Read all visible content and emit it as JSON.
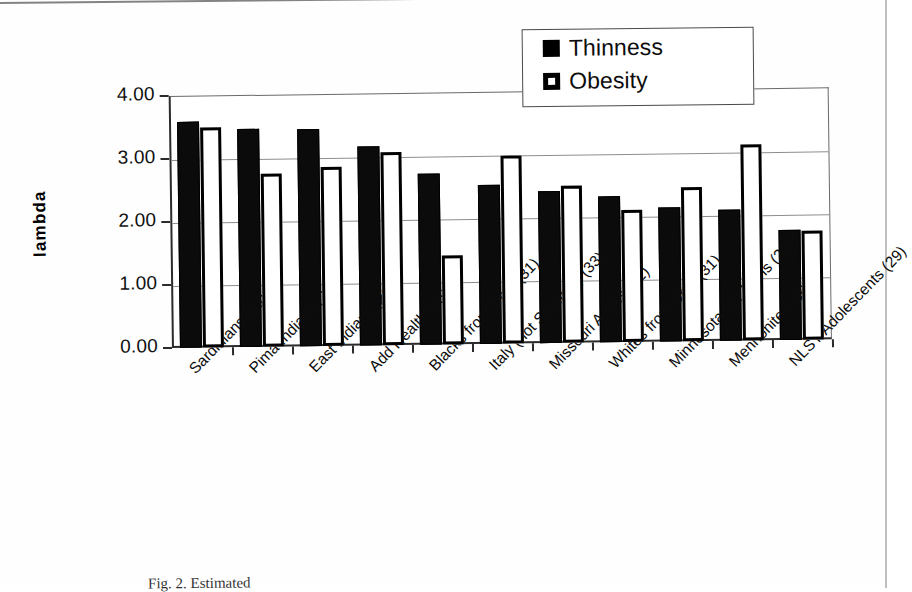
{
  "chart_data": {
    "type": "bar",
    "title": "",
    "xlabel": "",
    "ylabel": "lambda",
    "ylim": [
      0,
      4
    ],
    "ytick_labels": [
      "0.00",
      "1.00",
      "2.00",
      "3.00",
      "4.00"
    ],
    "ytick_values": [
      0,
      1,
      2,
      3,
      4
    ],
    "grid": true,
    "legend_position": "top-right",
    "categories": [
      "Sardinians (33)",
      "Pima Indians (34)",
      "East Indians (29)",
      "Add Health (35)",
      "Blacks from Ohio (31)",
      "Italy (not Sardinia) (33)",
      "Missouri Adults (32)",
      "Whites from Ohio (31)",
      "Minnesota DZ Twins (29)",
      "Mennonites (36)",
      "NLSY Adolescents (29)"
    ],
    "series": [
      {
        "name": "Thinness",
        "color": "#000000",
        "values": [
          3.58,
          3.46,
          3.44,
          3.16,
          2.72,
          2.52,
          2.42,
          2.31,
          2.13,
          2.08,
          1.74
        ]
      },
      {
        "name": "Obesity",
        "color": "#ffffff",
        "values": [
          3.5,
          2.75,
          2.84,
          3.07,
          1.42,
          2.98,
          2.5,
          2.1,
          2.45,
          3.11,
          1.73
        ]
      }
    ]
  },
  "legend": {
    "items": [
      {
        "label": "Thinness",
        "swatch": "filled-square-icon"
      },
      {
        "label": "Obesity",
        "swatch": "hollow-square-icon"
      }
    ]
  },
  "axis": {
    "y_title": "lambda"
  },
  "caption": {
    "text": "Fig. 2. Estimated"
  }
}
